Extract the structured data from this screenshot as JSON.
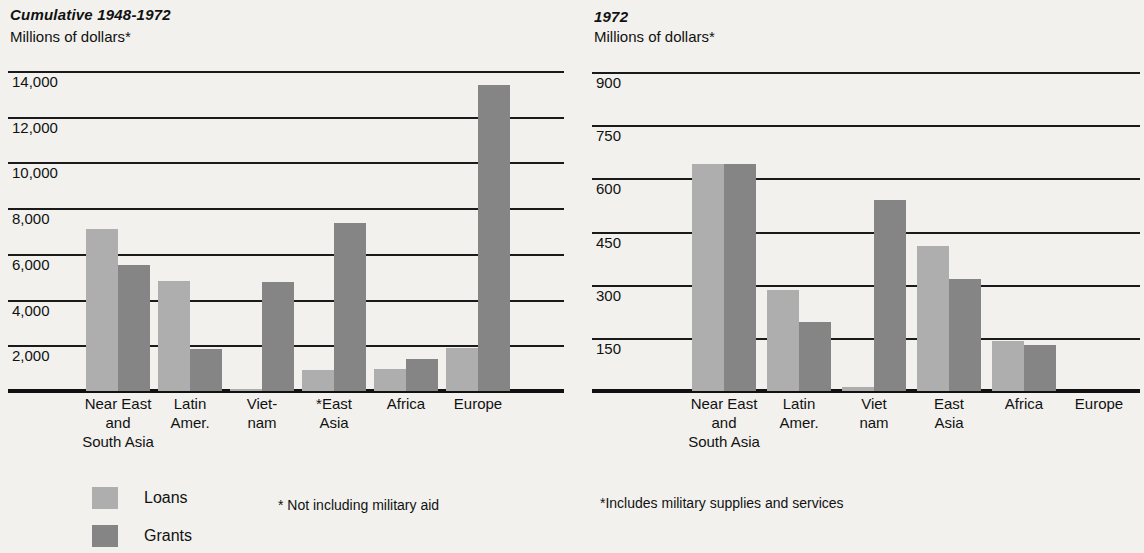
{
  "chart_data": [
    {
      "type": "bar",
      "title": "Cumulative 1948-1972",
      "subtitle": "Millions of dollars*",
      "ylabel": "Millions of dollars*",
      "xlabel": "",
      "categories": [
        "Near East and South Asia",
        "Latin Amer.",
        "Viet-nam",
        "*East Asia",
        "Africa",
        "Europe"
      ],
      "tick_labels": [
        "14,000",
        "12,000",
        "10,000",
        "8,000",
        "6,000",
        "4,000",
        "2,000"
      ],
      "ticks": [
        14000,
        12000,
        10000,
        8000,
        6000,
        4000,
        2000
      ],
      "ylim": [
        0,
        14650
      ],
      "grid": true,
      "legend": [
        "Loans",
        "Grants"
      ],
      "legend_position": "below-left",
      "series": [
        {
          "name": "Loans",
          "values": [
            7100,
            4800,
            80,
            900,
            950,
            1900
          ]
        },
        {
          "name": "Grants",
          "values": [
            5500,
            1850,
            4750,
            7350,
            1400,
            13400
          ]
        }
      ],
      "footnote": "* Not including military aid"
    },
    {
      "type": "bar",
      "title": "1972",
      "subtitle": "Millions of dollars*",
      "ylabel": "Millions of dollars*",
      "xlabel": "",
      "categories": [
        "Near East and South Asia",
        "Latin Amer.",
        "Viet nam",
        "East Asia",
        "Africa",
        "Europe"
      ],
      "tick_labels": [
        "900",
        "750",
        "600",
        "450",
        "300",
        "150"
      ],
      "ticks": [
        900,
        750,
        600,
        450,
        300,
        150
      ],
      "ylim": [
        0,
        940
      ],
      "grid": true,
      "legend": [
        "Loans",
        "Grants"
      ],
      "legend_position": "shared",
      "series": [
        {
          "name": "Loans",
          "values": [
            640,
            285,
            10,
            410,
            140,
            0
          ]
        },
        {
          "name": "Grants",
          "values": [
            640,
            195,
            540,
            315,
            130,
            0
          ]
        }
      ],
      "footnote": "*Includes military supplies and services"
    }
  ],
  "left": {
    "title": "Cumulative 1948-1972",
    "subtitle": "Millions of dollars*",
    "axis": {
      "labels": [
        "14,000",
        "12,000",
        "10,000",
        "8,000",
        "6,000",
        "4,000",
        "2,000"
      ]
    },
    "categories": [
      {
        "line1": "Near East",
        "line2": "and",
        "line3": "South Asia"
      },
      {
        "line1": "Latin",
        "line2": "Amer.",
        "line3": ""
      },
      {
        "line1": "Viet-",
        "line2": "nam",
        "line3": ""
      },
      {
        "line1": "*East",
        "line2": "Asia",
        "line3": ""
      },
      {
        "line1": "Africa",
        "line2": "",
        "line3": ""
      },
      {
        "line1": "Europe",
        "line2": "",
        "line3": ""
      }
    ],
    "footnote": "* Not including military aid"
  },
  "right": {
    "title": "1972",
    "subtitle": "Millions of dollars*",
    "axis": {
      "labels": [
        "900",
        "750",
        "600",
        "450",
        "300",
        "150"
      ]
    },
    "categories": [
      {
        "line1": "Near East",
        "line2": "and",
        "line3": "South Asia"
      },
      {
        "line1": "Latin",
        "line2": "Amer.",
        "line3": ""
      },
      {
        "line1": "Viet",
        "line2": "nam",
        "line3": ""
      },
      {
        "line1": "East",
        "line2": "Asia",
        "line3": ""
      },
      {
        "line1": "Africa",
        "line2": "",
        "line3": ""
      },
      {
        "line1": "Europe",
        "line2": "",
        "line3": ""
      }
    ],
    "footnote": "*Includes military supplies and services"
  },
  "legend": {
    "loans_label": "Loans",
    "grants_label": "Grants"
  },
  "colors": {
    "loans": "#aeaeae",
    "grants": "#858585",
    "rule": "#1a1a1a",
    "background": "#f2f1ee"
  }
}
